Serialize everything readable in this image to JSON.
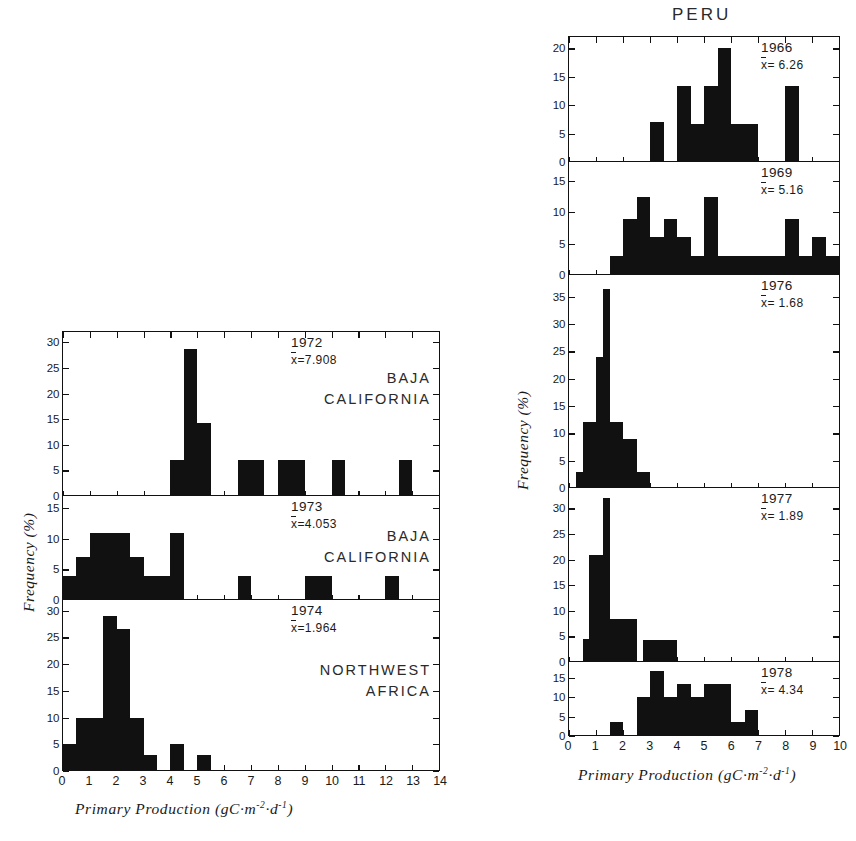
{
  "figure": {
    "left_column": {
      "axis_x_title_html": "Primary Production (gC·m⁻²·d⁻¹)",
      "axis_y_title": "Frequency (%)",
      "x_ticks": [
        "0",
        "1",
        "2",
        "3",
        "4",
        "5",
        "6",
        "7",
        "8",
        "9",
        "10",
        "11",
        "12",
        "13",
        "14"
      ],
      "xlim": [
        0,
        14
      ]
    },
    "right_column": {
      "supertitle": "PERU",
      "axis_x_title_html": "Primary Production (gC·m⁻²·d⁻¹)",
      "axis_y_title": "Frequency (%)",
      "x_ticks": [
        "0",
        "1",
        "2",
        "3",
        "4",
        "5",
        "6",
        "7",
        "8",
        "9",
        "10"
      ],
      "xlim": [
        0,
        10
      ]
    }
  },
  "chart_data": [
    {
      "type": "bar",
      "id": "baja-1972",
      "title": "1972",
      "mean_label": "x̄=7.908",
      "mean_prefix": "x",
      "mean_value": "=7.908",
      "region": [
        "BAJA",
        "CALIFORNIA"
      ],
      "xlabel": "Primary Production (gC·m⁻²·d⁻¹)",
      "ylabel": "Frequency (%)",
      "xlim": [
        0,
        14
      ],
      "ylim": [
        0,
        32
      ],
      "y_ticks": [
        0,
        5,
        10,
        15,
        20,
        25,
        30
      ],
      "bin_width": 0.5,
      "bins": [
        4.0,
        4.5,
        5.0,
        6.5,
        7.0,
        8.0,
        8.5,
        10.0,
        12.5
      ],
      "values": [
        7.1,
        28.6,
        14.3,
        7.1,
        7.1,
        7.1,
        7.1,
        7.1,
        7.1
      ],
      "grid": false
    },
    {
      "type": "bar",
      "id": "baja-1973",
      "title": "1973",
      "mean_label": "x̄=4.053",
      "mean_prefix": "x",
      "mean_value": "=4.053",
      "region": [
        "BAJA",
        "CALIFORNIA"
      ],
      "xlabel": "Primary Production (gC·m⁻²·d⁻¹)",
      "ylabel": "Frequency (%)",
      "xlim": [
        0,
        14
      ],
      "ylim": [
        0,
        17
      ],
      "y_ticks": [
        0,
        5,
        10,
        15
      ],
      "bin_width": 0.5,
      "bins": [
        0.0,
        0.5,
        1.0,
        1.5,
        2.0,
        2.5,
        3.0,
        3.5,
        4.0,
        4.5,
        6.5,
        9.0,
        9.5,
        12.0
      ],
      "values": [
        4.0,
        7.0,
        11.0,
        11.0,
        11.0,
        7.0,
        4.0,
        4.0,
        11.0,
        0.0,
        4.0,
        4.0,
        4.0,
        4.0
      ],
      "grid": false
    },
    {
      "type": "bar",
      "id": "nw-africa-1974",
      "title": "1974",
      "mean_label": "x̄=1.964",
      "mean_prefix": "x",
      "mean_value": "=1.964",
      "region": [
        "NORTHWEST",
        "AFRICA"
      ],
      "xlabel": "Primary Production (gC·m⁻²·d⁻¹)",
      "ylabel": "Frequency (%)",
      "xlim": [
        0,
        14
      ],
      "ylim": [
        0,
        32
      ],
      "y_ticks": [
        0,
        5,
        10,
        15,
        20,
        25,
        30
      ],
      "bin_width": 0.5,
      "bins": [
        0.0,
        0.5,
        1.0,
        1.5,
        2.0,
        2.5,
        3.0,
        3.5,
        4.0,
        4.5,
        5.0,
        5.5
      ],
      "values": [
        5.0,
        10.0,
        10.0,
        29.0,
        26.5,
        10.0,
        3.0,
        0.0,
        5.0,
        0.0,
        3.0,
        0.0
      ],
      "grid": false
    },
    {
      "type": "bar",
      "id": "peru-1966",
      "title": "1966",
      "mean_label": "x̄ = 6.26",
      "mean_prefix": "x",
      "mean_value": "= 6.26",
      "region": [],
      "xlabel": "Primary Production (gC·m⁻²·d⁻¹)",
      "ylabel": "Frequency (%)",
      "xlim": [
        0,
        10
      ],
      "ylim": [
        0,
        22
      ],
      "y_ticks": [
        0,
        5,
        10,
        15,
        20
      ],
      "bin_width": 0.5,
      "bins": [
        3.0,
        4.0,
        4.5,
        5.0,
        5.5,
        6.0,
        6.5,
        8.0
      ],
      "values": [
        7.0,
        13.3,
        6.7,
        13.3,
        20.0,
        6.7,
        6.7,
        13.3
      ],
      "grid": false
    },
    {
      "type": "bar",
      "id": "peru-1969",
      "title": "1969",
      "mean_label": "x̄ = 5.16",
      "mean_prefix": "x",
      "mean_value": "= 5.16",
      "region": [],
      "xlabel": "Primary Production (gC·m⁻²·d⁻¹)",
      "ylabel": "Frequency (%)",
      "xlim": [
        0,
        10
      ],
      "ylim": [
        0,
        18
      ],
      "y_ticks": [
        0,
        5,
        10,
        15
      ],
      "bin_width": 0.5,
      "bins": [
        1.5,
        2.0,
        2.5,
        3.0,
        3.5,
        4.0,
        4.5,
        5.0,
        5.5,
        6.0,
        6.5,
        7.0,
        7.5,
        8.0,
        8.5,
        9.0,
        9.5
      ],
      "values": [
        3.0,
        9.0,
        12.5,
        6.0,
        9.0,
        6.0,
        3.0,
        12.5,
        3.0,
        3.0,
        3.0,
        3.0,
        3.0,
        9.0,
        3.0,
        6.0,
        3.0
      ],
      "grid": false
    },
    {
      "type": "bar",
      "id": "peru-1976",
      "title": "1976",
      "mean_label": "x̄ = 1.68",
      "mean_prefix": "x",
      "mean_value": "= 1.68",
      "region": [],
      "xlabel": "Primary Production (gC·m⁻²·d⁻¹)",
      "ylabel": "Frequency (%)",
      "xlim": [
        0,
        10
      ],
      "ylim": [
        0,
        39
      ],
      "y_ticks": [
        0,
        5,
        10,
        15,
        20,
        25,
        30,
        35
      ],
      "bin_width": 0.25,
      "bins": [
        0.25,
        0.5,
        0.75,
        1.0,
        1.25,
        1.5,
        1.75,
        2.0,
        2.25,
        2.5,
        2.75
      ],
      "values": [
        3.0,
        12.0,
        12.0,
        24.0,
        36.5,
        12.0,
        12.0,
        9.0,
        9.0,
        3.0,
        3.0
      ],
      "grid": false
    },
    {
      "type": "bar",
      "id": "peru-1977",
      "title": "1977",
      "mean_label": "x̄ = 1.89",
      "mean_prefix": "x",
      "mean_value": "= 1.89",
      "region": [],
      "xlabel": "Primary Production (gC·m⁻²·d⁻¹)",
      "ylabel": "Frequency (%)",
      "xlim": [
        0,
        10
      ],
      "ylim": [
        0,
        34
      ],
      "y_ticks": [
        0,
        5,
        10,
        15,
        20,
        25,
        30
      ],
      "bin_width": 0.25,
      "bins": [
        0.5,
        0.75,
        1.0,
        1.25,
        1.5,
        1.75,
        2.0,
        2.25,
        2.5,
        2.75,
        3.0,
        3.25,
        3.5,
        3.75,
        4.0
      ],
      "values": [
        4.5,
        21.0,
        21.0,
        32.0,
        8.5,
        8.5,
        8.5,
        8.5,
        0.0,
        4.3,
        4.3,
        4.3,
        4.3,
        4.3,
        0.0
      ],
      "grid": false
    },
    {
      "type": "bar",
      "id": "peru-1978",
      "title": "1978",
      "mean_label": "x̄ = 4.34",
      "mean_prefix": "x",
      "mean_value": "= 4.34",
      "region": [],
      "xlabel": "Primary Production (gC·m⁻²·d⁻¹)",
      "ylabel": "Frequency (%)",
      "xlim": [
        0,
        10
      ],
      "ylim": [
        0,
        19
      ],
      "y_ticks": [
        0,
        5,
        10,
        15
      ],
      "bin_width": 0.5,
      "bins": [
        1.5,
        2.5,
        3.0,
        3.5,
        4.0,
        4.5,
        5.0,
        5.5,
        6.0,
        6.5
      ],
      "values": [
        3.7,
        10.0,
        16.8,
        10.0,
        13.4,
        10.0,
        13.4,
        13.4,
        3.7,
        6.7
      ],
      "grid": false
    }
  ]
}
